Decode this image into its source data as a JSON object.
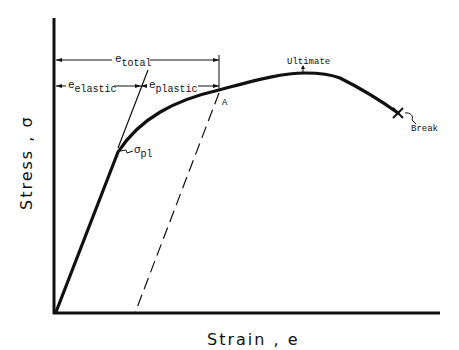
{
  "diagram": {
    "axes": {
      "x_label": "Strain , e",
      "y_label": "Stress , σ"
    },
    "annotations": {
      "e_total": {
        "base": "e",
        "sub": "total"
      },
      "e_elastic": {
        "base": "e",
        "sub": "elastic"
      },
      "e_plastic": {
        "base": "e",
        "sub": "plastic"
      },
      "point_a": "A",
      "proportional_limit": {
        "base": "σ",
        "sub": "pl"
      },
      "ultimate": "Ultimate",
      "break": "Break"
    },
    "colors": {
      "ink": "#111111",
      "background": "#ffffff"
    }
  }
}
